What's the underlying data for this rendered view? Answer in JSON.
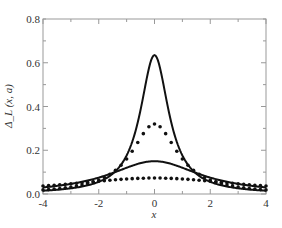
{
  "chart_data": {
    "type": "line",
    "title": "",
    "xlabel": "x",
    "ylabel": "Δ_L (x, a)",
    "xlim": [
      -4,
      4
    ],
    "ylim": [
      0,
      0.8
    ],
    "xticks": [
      "-4",
      "-2",
      "0",
      "2",
      "4"
    ],
    "yticks": [
      "0.0",
      "0.2",
      "0.4",
      "0.6",
      "0.8"
    ],
    "grid": false,
    "legend": null,
    "series": [
      {
        "name": "solid narrow peak",
        "style": "solid",
        "peak_x": 0,
        "peak_y": 0.635,
        "width": 0.62,
        "tail_y_at_4": 0.015
      },
      {
        "name": "dotted medium peak",
        "style": "dotted",
        "peak_x": 0,
        "peak_y": 0.32,
        "width": 1.0,
        "tail_y_at_4": 0.03
      },
      {
        "name": "solid broad peak",
        "style": "solid",
        "peak_x": 0,
        "peak_y": 0.15,
        "width": 2.0,
        "tail_y_at_4": 0.03
      },
      {
        "name": "dotted flat",
        "style": "dotted",
        "peak_x": 0,
        "peak_y": 0.073,
        "width": 4.0,
        "tail_y_at_4": 0.04
      }
    ]
  }
}
